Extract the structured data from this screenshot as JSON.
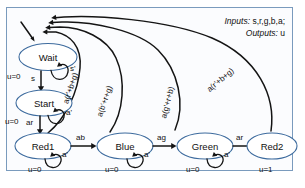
{
  "diagram": {
    "io": {
      "inputs_key": "Inputs:",
      "inputs_value": " s,r,g,b,a;",
      "outputs_key": "Outputs:",
      "outputs_value": " u"
    },
    "states": [
      {
        "id": "wait",
        "label": "Wait",
        "output": "u=0",
        "self_loop": "s'"
      },
      {
        "id": "start",
        "label": "Start",
        "output": "u=0",
        "self_loop": "a'"
      },
      {
        "id": "red1",
        "label": "Red1",
        "output": "u=0",
        "self_loop": "a'"
      },
      {
        "id": "blue",
        "label": "Blue",
        "output": "u=0",
        "self_loop": "a'"
      },
      {
        "id": "green",
        "label": "Green",
        "output": "u=0",
        "self_loop": "a'"
      },
      {
        "id": "red2",
        "label": "Red2",
        "output": "u=1",
        "self_loop": ""
      }
    ],
    "transitions": [
      {
        "id": "t-wait-start",
        "from": "wait",
        "to": "start",
        "label": "s"
      },
      {
        "id": "t-start-red1",
        "from": "start",
        "to": "red1",
        "label": "ar"
      },
      {
        "id": "t-red1-blue",
        "from": "red1",
        "to": "blue",
        "label": "ab"
      },
      {
        "id": "t-blue-green",
        "from": "blue",
        "to": "green",
        "label": "ag"
      },
      {
        "id": "t-green-red2",
        "from": "green",
        "to": "red2",
        "label": "ar"
      },
      {
        "id": "t-red1-wait",
        "from": "red1",
        "to": "wait",
        "label": "a(r'+b+g)"
      },
      {
        "id": "t-blue-wait",
        "from": "blue",
        "to": "wait",
        "label": "a(b'+r+g)"
      },
      {
        "id": "t-green-wait",
        "from": "green",
        "to": "wait",
        "label": "a(g'+r+b)"
      },
      {
        "id": "t-red2-wait",
        "from": "red2",
        "to": "wait",
        "label": "a(r'+b+g)"
      }
    ],
    "colors": {
      "frame_border": "#7a9bbd",
      "state_stroke": "#3d6b9e",
      "state_fill": "#ffffff",
      "edge": "#141414",
      "background": "#fbfcfe"
    }
  }
}
